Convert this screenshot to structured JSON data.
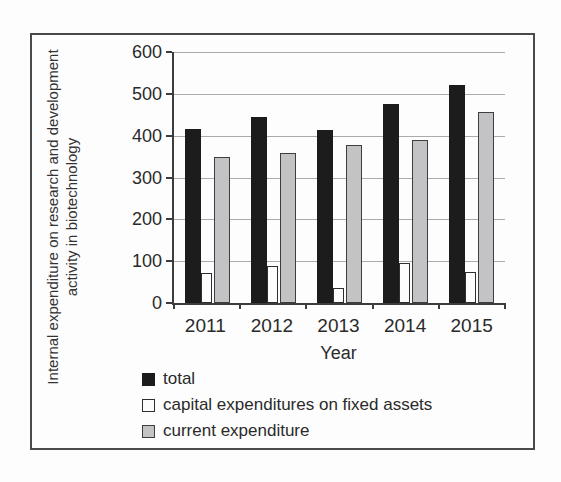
{
  "chart_data": {
    "type": "bar",
    "title": "",
    "xlabel": "Year",
    "ylabel": "Internal expenditure on research and development activity in biotechnology",
    "categories": [
      "2011",
      "2012",
      "2013",
      "2014",
      "2015"
    ],
    "series": [
      {
        "key": "total",
        "name": "total",
        "color": "#1c1c1c",
        "border": "#1c1c1c",
        "values": [
          415,
          445,
          413,
          475,
          522
        ]
      },
      {
        "key": "capital",
        "name": "capital expenditures on fixed assets",
        "color": "#fcfcfc",
        "border": "#2e2e2e",
        "values": [
          72,
          89,
          36,
          95,
          73
        ]
      },
      {
        "key": "current",
        "name": "current expenditure",
        "color": "#c3c3c6",
        "border": "#3e3e3e",
        "values": [
          348,
          359,
          377,
          390,
          456
        ]
      }
    ],
    "ylim": [
      0,
      600
    ],
    "yticks": [
      0,
      100,
      200,
      300,
      400,
      500,
      600
    ],
    "grid": true,
    "legend_position": "bottom-left",
    "colors": {
      "axis": "#3c3c3c",
      "gridline": "#aaaaaa",
      "frame_border": "#4a4a4a",
      "background": "#fdfdfd"
    }
  }
}
